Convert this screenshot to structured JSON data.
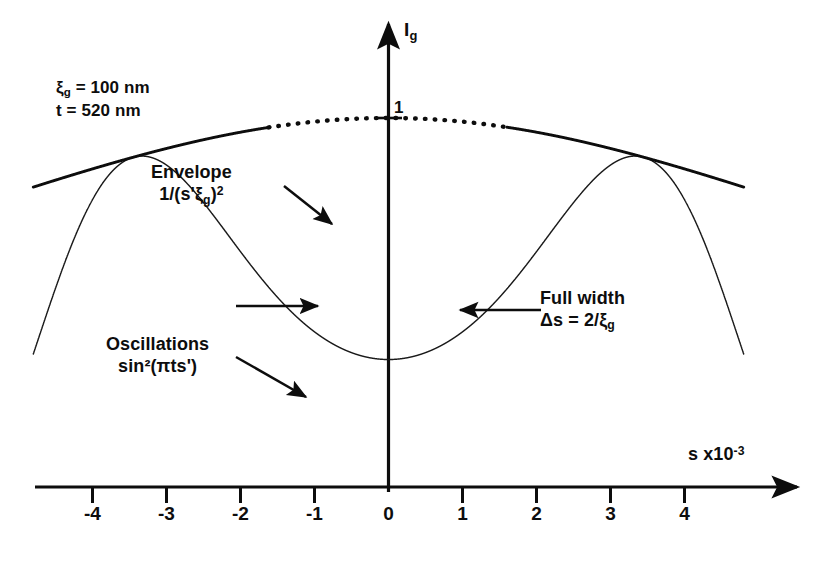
{
  "figure": {
    "parameters": {
      "extinction_distance_label": "ξ",
      "extinction_distance_sub": "g",
      "extinction_distance_text": "ξ_g = 100 nm",
      "extinction_distance_value": 100,
      "extinction_distance_unit": "nm",
      "thickness_text": "t = 520 nm",
      "thickness_value": 520,
      "thickness_unit": "nm"
    },
    "axes": {
      "y_label": "I",
      "y_label_sub": "g",
      "y_peak_tick": "1",
      "x_label": "s x10",
      "x_label_exponent": "-3",
      "x_ticks": [
        "-4",
        "-3",
        "-2",
        "-1",
        "0",
        "1",
        "2",
        "3",
        "4"
      ],
      "x_tick_values": [
        -4,
        -3,
        -2,
        -1,
        0,
        1,
        2,
        3,
        4
      ]
    },
    "annotations": {
      "envelope_line1": "Envelope",
      "envelope_line2_pre": "1/(s'",
      "envelope_line2_xi": "ξ",
      "envelope_line2_sub": "g",
      "envelope_line2_post": ")",
      "envelope_line2_sup": "2",
      "oscillations_line1": "Oscillations",
      "oscillations_line2": "sin²(πts')",
      "fullwidth_line1": "Full width",
      "fullwidth_line2_pre": "Δs = 2/",
      "fullwidth_line2_xi": "ξ",
      "fullwidth_line2_sub": "g"
    },
    "colors": {
      "ink": "#0d0d0d",
      "curve": "#1a1a1a",
      "background": "#ffffff"
    }
  },
  "chart_data": {
    "type": "line",
    "xlabel": "s x10^-3",
    "ylabel": "I_g",
    "xlim": [
      -4.8,
      4.8
    ],
    "ylim": [
      0,
      1.06
    ],
    "grid": false,
    "legend": null,
    "formula": "I_g = sin^2(pi*t*s') / (s'*xi_g)^2,  s' = sqrt(s^2 + 1/xi_g^2)",
    "parameters": {
      "xi_g_nm": 100,
      "t_nm": 520
    },
    "units": {
      "s": "nm^-1 x10^-3"
    },
    "series": [
      {
        "name": "Oscillations sin^2(pi t s')",
        "kind": "oscillation",
        "style": "solid"
      },
      {
        "name": "Envelope 1/(s' xi_g)^2",
        "kind": "envelope",
        "style": "dotted-center-solid-tails"
      }
    ],
    "key_points": [
      {
        "label": "peak value at s=0 envelope",
        "s": 0,
        "value": 1
      },
      {
        "label": "central minimum",
        "s": 0,
        "value": 0.56
      },
      {
        "label": "full width at envelope half points",
        "delta_s": 20,
        "note": "2/xi_g = 0.02 nm^-1"
      },
      {
        "label": "oscillation period",
        "value": 1.923,
        "note": "1/t in units of 10^-3 nm^-1"
      }
    ],
    "markers": [
      {
        "name": "full-width-left-arrow",
        "s": -1.0
      },
      {
        "name": "full-width-right-arrow",
        "s": 1.0
      }
    ]
  }
}
